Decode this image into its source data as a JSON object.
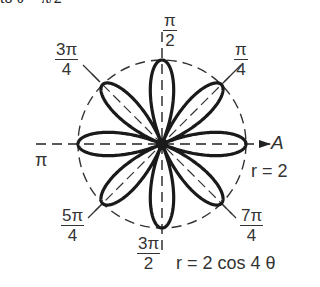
{
  "header_clipped_text": "to θ = π/2",
  "chart_data": {
    "type": "polar",
    "title": "",
    "equation": "r = 2 cos 4 θ",
    "reference_circle": "r = 2",
    "polar_axis_label": "A",
    "petals": 8,
    "max_radius": 2,
    "petal_angles": [
      "0",
      "π/4",
      "π/2",
      "3π/4",
      "π",
      "5π/4",
      "3π/2",
      "7π/4"
    ],
    "angle_labels": [
      {
        "num": "π",
        "den": "2",
        "angle": "π/2"
      },
      {
        "num": "π",
        "den": "4",
        "angle": "π/4"
      },
      {
        "num": "3π",
        "den": "4",
        "angle": "3π/4"
      },
      {
        "text": "π",
        "angle": "π"
      },
      {
        "num": "5π",
        "den": "4",
        "angle": "5π/4"
      },
      {
        "num": "3π",
        "den": "2",
        "angle": "3π/2"
      },
      {
        "num": "7π",
        "den": "4",
        "angle": "7π/4"
      }
    ]
  },
  "labels": {
    "pi_half_num": "π",
    "pi_half_den": "2",
    "pi_quarter_num": "π",
    "pi_quarter_den": "4",
    "three_pi_quarter_num": "3π",
    "three_pi_quarter_den": "4",
    "pi": "π",
    "five_pi_quarter_num": "5π",
    "five_pi_quarter_den": "4",
    "three_pi_half_num": "3π",
    "three_pi_half_den": "2",
    "seven_pi_quarter_num": "7π",
    "seven_pi_quarter_den": "4",
    "axis_A": "A",
    "circle_r": "r = 2",
    "rose_eq": "r = 2 cos 4 θ"
  },
  "colors": {
    "ink": "#222222",
    "background": "#ffffff"
  }
}
